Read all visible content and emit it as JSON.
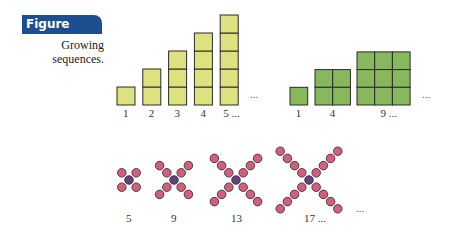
{
  "figure": {
    "label": "Figure 9.35",
    "caption_line1": "Growing",
    "caption_line2": "sequences.",
    "badge_color": "#1b4f91"
  },
  "colors": {
    "bar_fill": "#dde17e",
    "square_fill": "#87b95c",
    "dot_outer": "#d45f7c",
    "dot_center": "#6a3f7e",
    "stroke": "#2a2a2a"
  },
  "bars": {
    "items": [
      {
        "label": "1",
        "count": 1
      },
      {
        "label": "2",
        "count": 2
      },
      {
        "label": "3",
        "count": 3
      },
      {
        "label": "4",
        "count": 4
      },
      {
        "label": "5 ...",
        "count": 5
      }
    ],
    "ellipsis": "..."
  },
  "squares": {
    "items": [
      {
        "label": "1",
        "side": 1
      },
      {
        "label": "4",
        "side": 2
      },
      {
        "label": "9 ...",
        "side": 3
      }
    ],
    "ellipsis": "..."
  },
  "crosses": {
    "items": [
      {
        "label": "5",
        "arm": 1
      },
      {
        "label": "9",
        "arm": 2
      },
      {
        "label": "13",
        "arm": 3
      },
      {
        "label": "17 ...",
        "arm": 4
      }
    ],
    "ellipsis": "..."
  }
}
